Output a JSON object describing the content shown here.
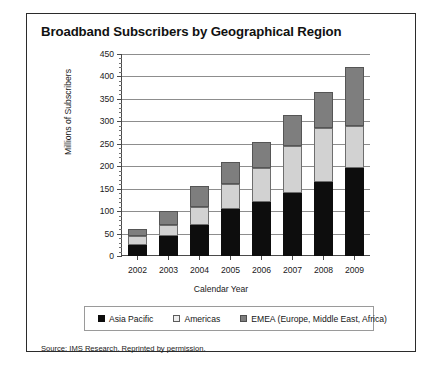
{
  "figure": {
    "title": "Broadband Subscribers by Geographical Region",
    "source_note": "Source: IMS Research. Reprinted by permission."
  },
  "legend": {
    "position": "bottom",
    "items": [
      {
        "label": "Asia Pacific",
        "color": "#0d0d0d",
        "swatch": "asia"
      },
      {
        "label": "Americas",
        "color": "#ededed",
        "swatch": "amer"
      },
      {
        "label": "EMEA (Europe, Middle East, Africa)",
        "color": "#7e7e7e",
        "swatch": "emea"
      }
    ]
  },
  "chart_data": {
    "type": "bar",
    "stacked": true,
    "title": "Broadband Subscribers by Geographical Region",
    "xlabel": "Calendar Year",
    "ylabel": "Millions of Subscribers",
    "categories": [
      "2002",
      "2003",
      "2004",
      "2005",
      "2006",
      "2007",
      "2008",
      "2009"
    ],
    "series": [
      {
        "name": "Asia Pacific",
        "color": "#0d0d0d",
        "values": [
          25,
          45,
          68,
          105,
          120,
          140,
          165,
          195
        ]
      },
      {
        "name": "Americas",
        "color": "#ededed",
        "values": [
          20,
          25,
          42,
          55,
          75,
          105,
          120,
          95
        ]
      },
      {
        "name": "EMEA (Europe, Middle East, Africa)",
        "color": "#7e7e7e",
        "values": [
          15,
          30,
          45,
          50,
          60,
          70,
          80,
          130
        ]
      }
    ],
    "totals": [
      60,
      100,
      155,
      210,
      255,
      315,
      365,
      420
    ],
    "ylim": [
      0,
      450
    ],
    "yticks": [
      0,
      50,
      100,
      150,
      200,
      250,
      300,
      350,
      400,
      450
    ],
    "ytick_labels": [
      "0",
      "50",
      "100",
      "150",
      "200",
      "250",
      "300",
      "350",
      "400",
      "450"
    ],
    "grid": true,
    "grid_axis": "y",
    "minor_ticks": true
  }
}
